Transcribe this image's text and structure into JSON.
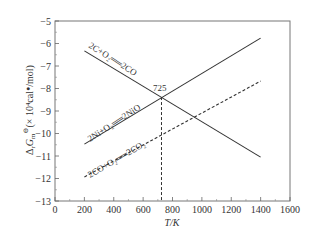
{
  "chart_data": {
    "type": "line",
    "title": "",
    "xlabel": "T/K",
    "ylabel": "ΔrGm⊖(×10⁴cal·mol)",
    "ylabel_parts": {
      "main": "Δ",
      "sub_r": "r",
      "G": "G",
      "sub_m": "m",
      "sup": "⊖",
      "rest": "(× 10⁴cal",
      "dot": "●",
      "tail": "/mol)"
    },
    "xlim": [
      0,
      1600
    ],
    "ylim": [
      -13,
      -5
    ],
    "xticks": [
      0,
      200,
      400,
      600,
      800,
      1000,
      1200,
      1400,
      1600
    ],
    "yticks": [
      -5,
      -6,
      -7,
      -8,
      -9,
      -10,
      -11,
      -12,
      -13
    ],
    "grid": false,
    "legend": "none (lines labeled inline)",
    "series": [
      {
        "name": "2C+O2 = 2CO",
        "label_text": "2C+O₂══2CO",
        "style": "solid",
        "x": [
          200,
          1400
        ],
        "y": [
          -6.33,
          -11.05
        ]
      },
      {
        "name": "2Ni+O2 = 2NiO",
        "label_text": "2Ni+O₂══2NiO",
        "style": "solid",
        "x": [
          200,
          1400
        ],
        "y": [
          -10.47,
          -5.76
        ]
      },
      {
        "name": "2CO+O2 = 2CO2",
        "label_text": "2CO+O₂══2CO₂",
        "style": "dashed",
        "x": [
          200,
          1400
        ],
        "y": [
          -11.93,
          -7.67
        ]
      }
    ],
    "annotations": [
      {
        "text": "725",
        "x": 725,
        "y": -8.38,
        "note": "intersection of 2C+O2=2CO and 2Ni+O2=2NiO; vertical dashed line to T axis"
      }
    ]
  },
  "labels": {
    "axis_x": "T/K",
    "intersection": "725",
    "rxn_c": "2C+O₂══2CO",
    "rxn_ni": "2Ni+O₂══2NiO",
    "rxn_co": "2CO+O₂══2CO₂"
  }
}
